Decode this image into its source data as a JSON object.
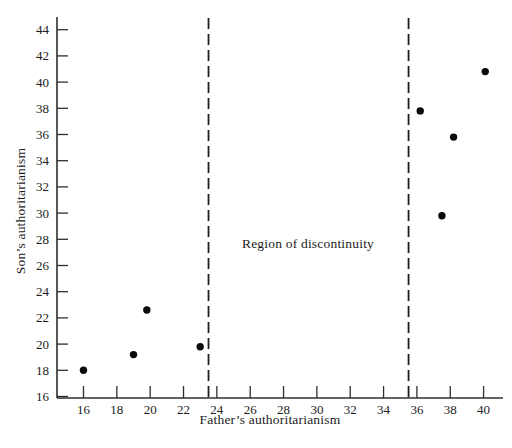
{
  "chart_data": {
    "type": "scatter",
    "title": "",
    "xlabel": "Father’s authoritarianism",
    "ylabel": "Son’s authoritarianism",
    "annotation": "Region of discontinuity",
    "x_ticks": [
      16,
      18,
      20,
      22,
      24,
      26,
      28,
      30,
      32,
      34,
      36,
      38,
      40
    ],
    "y_ticks": [
      16,
      18,
      20,
      22,
      24,
      26,
      28,
      30,
      32,
      34,
      36,
      38,
      40,
      42,
      44
    ],
    "xlim": [
      14.4,
      41.2
    ],
    "ylim": [
      15.8,
      45.0
    ],
    "grid": false,
    "legend": null,
    "points": [
      {
        "x": 16.0,
        "y": 18.0
      },
      {
        "x": 19.0,
        "y": 19.2
      },
      {
        "x": 19.8,
        "y": 22.6
      },
      {
        "x": 23.0,
        "y": 19.8
      },
      {
        "x": 36.2,
        "y": 37.8
      },
      {
        "x": 37.5,
        "y": 29.8
      },
      {
        "x": 38.2,
        "y": 35.8
      },
      {
        "x": 40.1,
        "y": 40.8
      }
    ],
    "discontinuity_lines_x": [
      23.5,
      35.5
    ],
    "colors": {
      "background": "#ffffff",
      "axis": "#2e2e2e",
      "tick": "#2e2e2e",
      "dashed_line": "#1f1f1f",
      "point": "#0a0a0a",
      "text": "#1c1c1c"
    }
  }
}
